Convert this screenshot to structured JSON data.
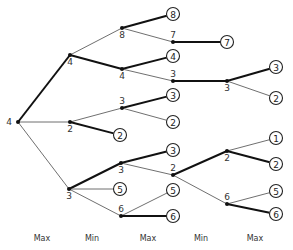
{
  "colors": {
    "edge": "#4a4a4a",
    "bold_edge": "#111111",
    "node": "#111111",
    "background": "#ffffff"
  },
  "levels": [
    {
      "label": "Max",
      "x": 42
    },
    {
      "label": "Min",
      "x": 92
    },
    {
      "label": "Max",
      "x": 148
    },
    {
      "label": "Min",
      "x": 201
    },
    {
      "label": "Max",
      "x": 255
    }
  ],
  "nodes": [
    {
      "id": "root",
      "value": "4",
      "x": 18,
      "y": 122,
      "level": "Max",
      "label_pos": "left"
    },
    {
      "id": "a",
      "value": "4",
      "x": 70,
      "y": 55,
      "level": "Min",
      "label_pos": "below"
    },
    {
      "id": "b",
      "value": "2",
      "x": 70,
      "y": 122,
      "level": "Min",
      "label_pos": "below"
    },
    {
      "id": "c",
      "value": "3",
      "x": 69,
      "y": 189,
      "level": "Min",
      "label_pos": "below"
    },
    {
      "id": "a1",
      "value": "8",
      "x": 122,
      "y": 28,
      "level": "Max",
      "label_pos": "below"
    },
    {
      "id": "a2",
      "value": "4",
      "x": 122,
      "y": 69,
      "level": "Max",
      "label_pos": "below"
    },
    {
      "id": "b1",
      "value": "3",
      "x": 122,
      "y": 108,
      "level": "Max",
      "label_pos": "above"
    },
    {
      "id": "c1",
      "value": "3",
      "x": 121,
      "y": 163,
      "level": "Max",
      "label_pos": "below"
    },
    {
      "id": "c2",
      "value": "6",
      "x": 121,
      "y": 216,
      "level": "Max",
      "label_pos": "above"
    },
    {
      "id": "a1b",
      "value": "7",
      "x": 173,
      "y": 42,
      "level": "Min",
      "label_pos": "above"
    },
    {
      "id": "a2b",
      "value": "3",
      "x": 173,
      "y": 81,
      "level": "Min",
      "label_pos": "above"
    },
    {
      "id": "c1b",
      "value": "2",
      "x": 173,
      "y": 175,
      "level": "Min",
      "label_pos": "above"
    },
    {
      "id": "a2b1",
      "value": "3",
      "x": 227,
      "y": 81,
      "level": "Max",
      "label_pos": "below"
    },
    {
      "id": "c1b1",
      "value": "2",
      "x": 227,
      "y": 151,
      "level": "Max",
      "label_pos": "below"
    },
    {
      "id": "c1b2",
      "value": "6",
      "x": 227,
      "y": 204,
      "level": "Max",
      "label_pos": "above"
    }
  ],
  "leaves": [
    {
      "id": "l1",
      "value": "8",
      "x": 173,
      "y": 14
    },
    {
      "id": "l2",
      "value": "7",
      "x": 227,
      "y": 42
    },
    {
      "id": "l3",
      "value": "4",
      "x": 173,
      "y": 56
    },
    {
      "id": "l4",
      "value": "3",
      "x": 276,
      "y": 67
    },
    {
      "id": "l5",
      "value": "2",
      "x": 276,
      "y": 98
    },
    {
      "id": "l6",
      "value": "3",
      "x": 173,
      "y": 95
    },
    {
      "id": "l7",
      "value": "2",
      "x": 173,
      "y": 122
    },
    {
      "id": "l8",
      "value": "2",
      "x": 120,
      "y": 135
    },
    {
      "id": "l9",
      "value": "3",
      "x": 173,
      "y": 150
    },
    {
      "id": "l10",
      "value": "1",
      "x": 276,
      "y": 138
    },
    {
      "id": "l11",
      "value": "2",
      "x": 276,
      "y": 164
    },
    {
      "id": "l12",
      "value": "5",
      "x": 120,
      "y": 189
    },
    {
      "id": "l13",
      "value": "5",
      "x": 173,
      "y": 190
    },
    {
      "id": "l14",
      "value": "5",
      "x": 276,
      "y": 191
    },
    {
      "id": "l15",
      "value": "6",
      "x": 173,
      "y": 216
    },
    {
      "id": "l16",
      "value": "6",
      "x": 276,
      "y": 214
    }
  ],
  "edges": [
    {
      "from": "root",
      "to": "a",
      "bold": true
    },
    {
      "from": "root",
      "to": "b",
      "bold": false
    },
    {
      "from": "root",
      "to": "c",
      "bold": false
    },
    {
      "from": "a",
      "to": "a1",
      "bold": false
    },
    {
      "from": "a",
      "to": "a2",
      "bold": true
    },
    {
      "from": "a1",
      "to": "l1",
      "bold": true
    },
    {
      "from": "a1",
      "to": "a1b",
      "bold": false
    },
    {
      "from": "a1b",
      "to": "l2",
      "bold": true
    },
    {
      "from": "a2",
      "to": "l3",
      "bold": true
    },
    {
      "from": "a2",
      "to": "a2b",
      "bold": false
    },
    {
      "from": "a2b",
      "to": "a2b1",
      "bold": true
    },
    {
      "from": "a2b1",
      "to": "l4",
      "bold": true
    },
    {
      "from": "a2b1",
      "to": "l5",
      "bold": false
    },
    {
      "from": "b",
      "to": "b1",
      "bold": false
    },
    {
      "from": "b",
      "to": "l8",
      "bold": true
    },
    {
      "from": "b1",
      "to": "l6",
      "bold": true
    },
    {
      "from": "b1",
      "to": "l7",
      "bold": false
    },
    {
      "from": "c",
      "to": "c1",
      "bold": true
    },
    {
      "from": "c",
      "to": "l12",
      "bold": false
    },
    {
      "from": "c",
      "to": "c2",
      "bold": false
    },
    {
      "from": "c1",
      "to": "l9",
      "bold": true
    },
    {
      "from": "c1",
      "to": "c1b",
      "bold": false
    },
    {
      "from": "c1b",
      "to": "c1b1",
      "bold": true
    },
    {
      "from": "c1b",
      "to": "c1b2",
      "bold": false
    },
    {
      "from": "c1b1",
      "to": "l10",
      "bold": false
    },
    {
      "from": "c1b1",
      "to": "l11",
      "bold": true
    },
    {
      "from": "c1b2",
      "to": "l14",
      "bold": false
    },
    {
      "from": "c1b2",
      "to": "l16",
      "bold": true
    },
    {
      "from": "c2",
      "to": "l13",
      "bold": false
    },
    {
      "from": "c2",
      "to": "l15",
      "bold": true
    }
  ]
}
